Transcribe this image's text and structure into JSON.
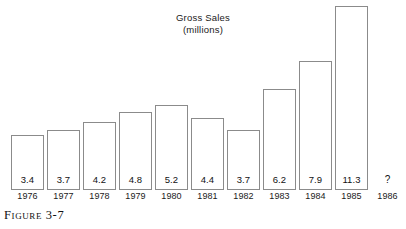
{
  "figure": {
    "caption": "Figure 3-7"
  },
  "chart_data": {
    "type": "bar",
    "title": "Gross Sales",
    "subtitle": "(millions)",
    "xlabel": "",
    "ylabel": "",
    "ylim": [
      0,
      11.6
    ],
    "grid": false,
    "legend": "none",
    "categories": [
      "1976",
      "1977",
      "1978",
      "1979",
      "1980",
      "1981",
      "1982",
      "1983",
      "1984",
      "1985",
      "1986"
    ],
    "values": [
      3.4,
      3.7,
      4.2,
      4.8,
      5.2,
      4.4,
      3.7,
      6.2,
      7.9,
      11.3,
      null
    ],
    "value_labels": [
      "3.4",
      "3.7",
      "4.2",
      "4.8",
      "5.2",
      "4.4",
      "3.7",
      "6.2",
      "7.9",
      "11.3",
      "?"
    ],
    "bars": [
      {
        "year": "1976",
        "value": 3.4,
        "label": "3.4",
        "has_bar": true
      },
      {
        "year": "1977",
        "value": 3.7,
        "label": "3.7",
        "has_bar": true
      },
      {
        "year": "1978",
        "value": 4.2,
        "label": "4.2",
        "has_bar": true
      },
      {
        "year": "1979",
        "value": 4.8,
        "label": "4.8",
        "has_bar": true
      },
      {
        "year": "1980",
        "value": 5.2,
        "label": "5.2",
        "has_bar": true
      },
      {
        "year": "1981",
        "value": 4.4,
        "label": "4.4",
        "has_bar": true
      },
      {
        "year": "1982",
        "value": 3.7,
        "label": "3.7",
        "has_bar": true
      },
      {
        "year": "1983",
        "value": 6.2,
        "label": "6.2",
        "has_bar": true
      },
      {
        "year": "1984",
        "value": 7.9,
        "label": "7.9",
        "has_bar": true
      },
      {
        "year": "1985",
        "value": 11.3,
        "label": "11.3",
        "has_bar": true
      },
      {
        "year": "1986",
        "value": null,
        "label": "?",
        "has_bar": false
      }
    ],
    "colors": {
      "bar_fill": "#ffffff",
      "bar_border": "#8b8b8b",
      "text": "#1a1a1a",
      "background": "#ffffff"
    }
  }
}
